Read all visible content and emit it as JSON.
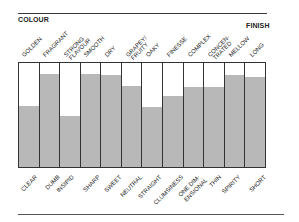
{
  "chart_data": {
    "type": "bar",
    "title": "",
    "left_header": "COLOUR",
    "right_header": "FINISH",
    "top_labels": [
      "GOLDEN",
      "FRAGRANT",
      "STRONG FLAVOUR",
      "SMOOTH",
      "DRY",
      "GRAPEY/ FRUITY",
      "OAKY",
      "FINESSE",
      "COMPLEX",
      "CONCEN- TRATED",
      "MELLOW",
      "LONG"
    ],
    "bottom_labels": [
      "CLEAR",
      "DUMB",
      "INSIPID",
      "SHARP",
      "SWEET",
      "NEUTRAL",
      "STRAIGHT",
      "CLUMSINESS",
      "ONE DIM- ENSIONAL",
      "THIN",
      "SPIRITY",
      "SHORT"
    ],
    "categories": [
      "GOLDEN/CLEAR",
      "FRAGRANT/DUMB",
      "STRONG FLAVOUR/INSIPID",
      "SMOOTH/SHARP",
      "DRY/SWEET",
      "GRAPEY-FRUITY/NEUTRAL",
      "OAKY/STRAIGHT",
      "FINESSE/CLUMSINESS",
      "COMPLEX/ONE DIMENSIONAL",
      "CONCENTRATED/THIN",
      "MELLOW/SPIRITY",
      "LONG/SHORT"
    ],
    "values": [
      59,
      89,
      49,
      89,
      88,
      78,
      58,
      68,
      77,
      77,
      88,
      87
    ],
    "ylim": [
      0,
      100
    ],
    "xlabel": "",
    "ylabel": "",
    "grid": false,
    "legend": "none"
  },
  "colors": {
    "fill": "#b8b8b8",
    "empty": "#ffffff",
    "line": "#333333"
  }
}
